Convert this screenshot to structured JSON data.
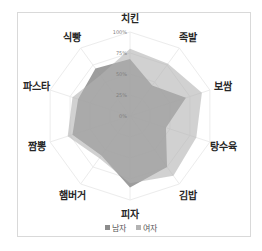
{
  "chart_data": {
    "type": "radar",
    "title": "",
    "categories": [
      "치킨",
      "족발",
      "보쌈",
      "탕수육",
      "김밥",
      "피자",
      "햄버거",
      "짬뽕",
      "파스타",
      "식빵"
    ],
    "ticks": [
      "0%",
      "25%",
      "50%",
      "75%",
      "100%"
    ],
    "range": [
      0,
      100
    ],
    "series": [
      {
        "name": "남자",
        "color": "#8c8c8c",
        "values": [
          68,
          45,
          70,
          45,
          75,
          85,
          58,
          72,
          65,
          70
        ]
      },
      {
        "name": "여자",
        "color": "#b3b3b3",
        "values": [
          80,
          77,
          90,
          83,
          88,
          80,
          62,
          78,
          72,
          60
        ]
      }
    ],
    "legend_position": "bottom",
    "grid": true
  },
  "legend": {
    "items": [
      {
        "label": "남자",
        "color": "#8c8c8c"
      },
      {
        "label": "여자",
        "color": "#b3b3b3"
      }
    ]
  }
}
